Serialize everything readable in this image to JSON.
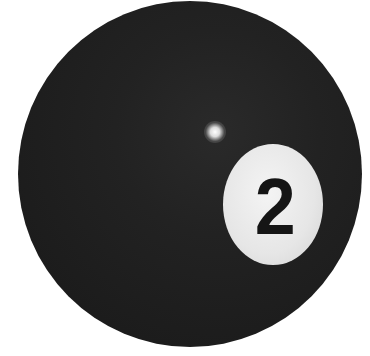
{
  "image": {
    "subject": "billiard ball",
    "ball_color": "#1e1e1e",
    "disc_color": "#e8e8e8",
    "number_color": "#151515",
    "number": "2"
  }
}
